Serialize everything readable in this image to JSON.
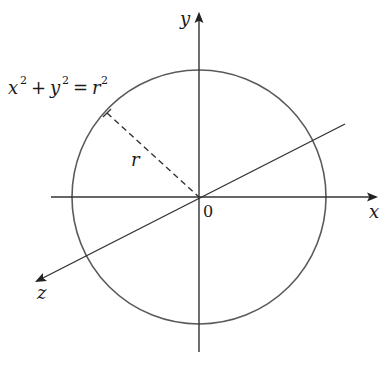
{
  "diagram": {
    "type": "circle-in-3d-axes",
    "equation": {
      "x": "x",
      "plus": "+",
      "y": "y",
      "equals": "=",
      "r": "r",
      "exp": "2"
    },
    "axes": {
      "x_label": "x",
      "y_label": "y",
      "z_label": "z",
      "origin_label": "0"
    },
    "radius_label": "r",
    "colors": {
      "stroke": "#555555",
      "axis": "#333333",
      "text": "#1a1a1a"
    }
  }
}
